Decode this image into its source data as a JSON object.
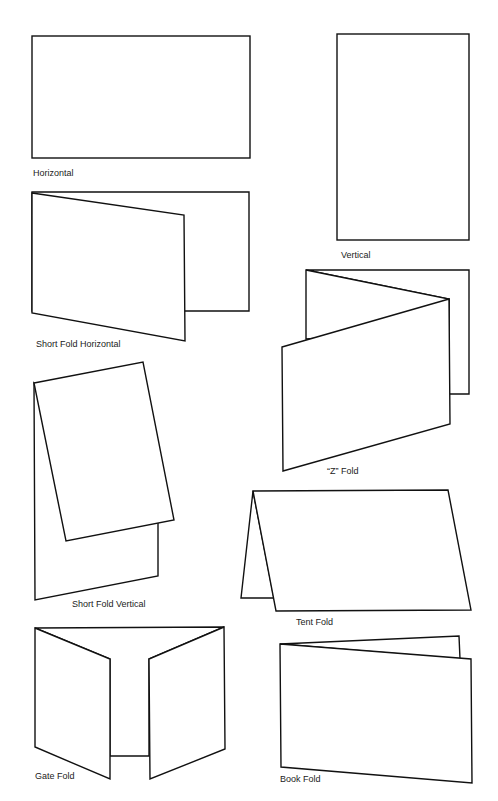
{
  "items": [
    {
      "id": "horizontal",
      "label": "Horizontal"
    },
    {
      "id": "vertical",
      "label": "Vertical"
    },
    {
      "id": "short-fold-horizontal",
      "label": "Short Fold Horizontal"
    },
    {
      "id": "z-fold",
      "label": "“Z” Fold"
    },
    {
      "id": "short-fold-vertical",
      "label": "Short Fold Vertical"
    },
    {
      "id": "tent-fold",
      "label": "Tent Fold"
    },
    {
      "id": "gate-fold",
      "label": "Gate Fold"
    },
    {
      "id": "book-fold",
      "label": "Book Fold"
    }
  ],
  "colors": {
    "stroke": "#111111",
    "background": "#ffffff",
    "text": "#222222"
  }
}
